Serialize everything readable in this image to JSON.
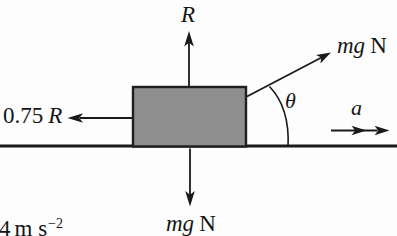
{
  "diagram": {
    "labels": {
      "normal_force": "R",
      "applied_force_symbol": "mg",
      "applied_force_unit": "N",
      "angle_symbol": "θ",
      "acceleration_symbol": "a",
      "friction_coefficient": "0.75",
      "friction_symbol": "R",
      "weight_symbol": "mg",
      "weight_unit": "N",
      "corner_value": "4",
      "corner_units": "m s",
      "corner_exponent": "−2"
    },
    "colors": {
      "background": "#fdfdfd",
      "line": "#1a1a1a",
      "block_fill": "#8e8e8e",
      "block_stroke": "#1f1f1f",
      "text": "#151515"
    }
  }
}
